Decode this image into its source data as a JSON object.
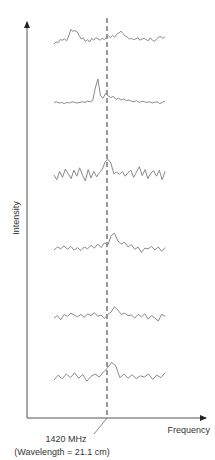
{
  "chart_data": {
    "type": "line",
    "title": "",
    "xlabel": "Frequency",
    "ylabel": "Intensity",
    "annotation": {
      "line1": "1420 MHz",
      "line2": "(Wavelength = 21.1 cm)",
      "x_position": "1420 MHz"
    },
    "grid": false,
    "legend": null,
    "series": [
      {
        "name": "spectrum-1",
        "baseline_y": 45,
        "peak_offset": "at/right of 1420 MHz, broad",
        "values": [
          0.2,
          0.5,
          0.4,
          0.9,
          0.8,
          1.0,
          0.7,
          1.5,
          2.6,
          2.3,
          2.4,
          2.2,
          1.6,
          1.0,
          1.2,
          0.6,
          0.9,
          0.5,
          1.1,
          0.8,
          1.2,
          1.0,
          0.8,
          1.1,
          0.9,
          1.3,
          1.5,
          1.2,
          1.6,
          1.3,
          1.8,
          2.0,
          2.3,
          1.9,
          1.5,
          1.3,
          1.0,
          1.1,
          0.9,
          1.0,
          1.2,
          0.8,
          1.0,
          1.1,
          0.9,
          0.7,
          1.2,
          0.8,
          0.6,
          1.0,
          1.3,
          1.4,
          1.1,
          1.4
        ]
      },
      {
        "name": "spectrum-2",
        "baseline_y": 103,
        "peak_offset": "just left of 1420 MHz, narrow and strong",
        "values": [
          0.1,
          0.2,
          0.0,
          0.1,
          -0.1,
          0.1,
          0.0,
          0.2,
          0.1,
          0.0,
          0.1,
          0.2,
          0.1,
          0.3,
          0.2,
          0.4,
          2.5,
          4.0,
          1.2,
          0.8,
          1.6,
          1.2,
          0.9,
          1.1,
          0.6,
          0.8,
          0.5,
          0.7,
          0.4,
          0.5,
          0.3,
          0.2,
          0.4,
          0.1,
          0.3,
          0.2,
          0.1,
          0.2,
          0.0,
          0.1,
          0.2,
          -0.1,
          0.1,
          0.3
        ]
      },
      {
        "name": "spectrum-3",
        "baseline_y": 175,
        "peak_offset": "at 1420 MHz",
        "values": [
          0.0,
          -0.8,
          0.6,
          -0.4,
          1.0,
          0.2,
          -0.6,
          0.8,
          -0.2,
          1.2,
          0.0,
          -1.0,
          0.9,
          -0.5,
          0.6,
          -0.3,
          0.4,
          1.0,
          2.2,
          2.6,
          2.0,
          0.2,
          0.5,
          0.1,
          0.6,
          -0.2,
          0.4,
          0.8,
          -0.4,
          0.5,
          1.4,
          -0.1,
          0.9,
          -0.6,
          0.3,
          0.7,
          -0.2,
          0.8,
          -0.8,
          0.6
        ]
      },
      {
        "name": "spectrum-4",
        "baseline_y": 250,
        "peak_offset": "at/right of 1420 MHz",
        "values": [
          0.0,
          0.5,
          0.2,
          0.7,
          0.1,
          0.6,
          0.0,
          0.4,
          -0.1,
          0.5,
          0.2,
          0.8,
          0.3,
          1.0,
          0.4,
          1.2,
          0.8,
          2.4,
          2.8,
          1.5,
          1.0,
          1.3,
          0.5,
          0.9,
          0.1,
          0.5,
          -0.4,
          0.3,
          0.2,
          0.6,
          0.0,
          0.5,
          -0.2,
          0.4
        ]
      },
      {
        "name": "spectrum-5",
        "baseline_y": 318,
        "peak_offset": "at 1420 MHz, weak",
        "values": [
          0.0,
          0.4,
          -0.3,
          0.6,
          0.3,
          0.8,
          0.5,
          0.2,
          0.6,
          0.1,
          0.7,
          0.4,
          0.9,
          0.3,
          0.5,
          -0.1,
          0.6,
          1.0,
          1.9,
          1.3,
          0.6,
          0.8,
          0.4,
          0.5,
          0.0,
          0.6,
          0.2,
          0.7,
          -0.2,
          0.4,
          0.0,
          -0.5,
          0.6,
          0.3
        ]
      },
      {
        "name": "spectrum-6",
        "baseline_y": 380,
        "peak_offset": "just left of 1420 MHz",
        "values": [
          0.0,
          0.8,
          0.2,
          1.0,
          0.4,
          1.2,
          0.3,
          0.9,
          -0.2,
          0.6,
          1.0,
          0.5,
          1.3,
          2.0,
          2.9,
          2.4,
          0.4,
          1.0,
          0.3,
          0.9,
          0.2,
          0.7,
          0.5,
          1.0,
          0.1,
          0.8,
          0.4,
          1.2
        ]
      }
    ]
  }
}
